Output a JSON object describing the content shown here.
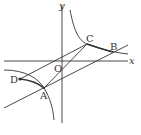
{
  "figure": {
    "axes": {
      "x_label": "x",
      "y_label": "y",
      "origin_label": "O"
    },
    "points": [
      {
        "name": "A",
        "x": 44,
        "y": 88
      },
      {
        "name": "B",
        "x": 113,
        "y": 52
      },
      {
        "name": "C",
        "x": 87,
        "y": 44
      },
      {
        "name": "D",
        "x": 20,
        "y": 79
      }
    ],
    "colors": {
      "stroke": "#333333",
      "background": "#ffffff"
    }
  }
}
